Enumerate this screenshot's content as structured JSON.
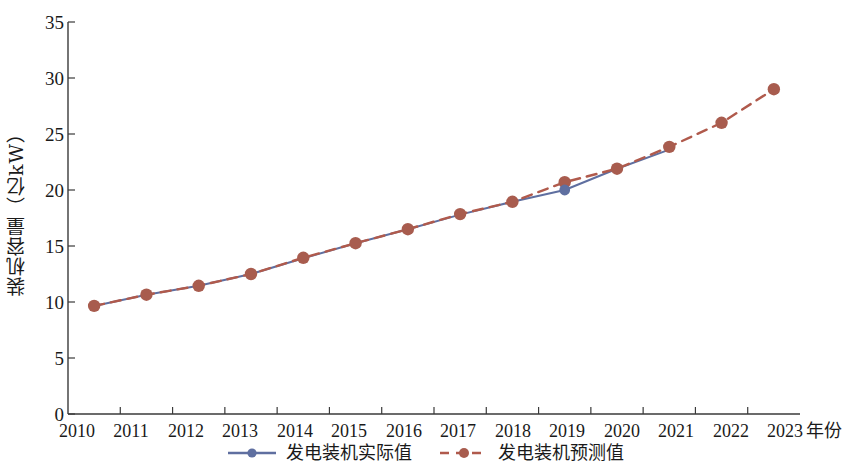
{
  "chart_data": {
    "type": "line",
    "title": "",
    "xlabel": "年份",
    "ylabel": "装机容量（亿kW）",
    "categories": [
      "2010",
      "2011",
      "2012",
      "2013",
      "2014",
      "2015",
      "2016",
      "2017",
      "2018",
      "2019",
      "2020",
      "2021",
      "2022",
      "2023"
    ],
    "x": [
      2010,
      2011,
      2012,
      2013,
      2014,
      2015,
      2016,
      2017,
      2018,
      2019,
      2020,
      2021,
      2022,
      2023
    ],
    "xlim": [
      2009.5,
      2023.5
    ],
    "ylim": [
      0,
      35
    ],
    "yticks": [
      0,
      5,
      10,
      15,
      20,
      25,
      30,
      35
    ],
    "grid": false,
    "legend_position": "bottom-center",
    "series": [
      {
        "name": "发电装机实际值",
        "style": "solid",
        "color": "#5f6fa0",
        "marker": "circle",
        "values": [
          9.65,
          10.65,
          11.45,
          12.5,
          13.9,
          15.25,
          16.5,
          17.8,
          18.95,
          20.0,
          21.9,
          23.6,
          null,
          null
        ]
      },
      {
        "name": "发电装机预测值",
        "style": "dashed",
        "color": "#b05a4c",
        "marker": "circle",
        "values": [
          9.65,
          10.65,
          11.45,
          12.5,
          13.95,
          15.25,
          16.5,
          17.85,
          18.95,
          20.7,
          21.9,
          23.85,
          26.0,
          29.0
        ]
      }
    ]
  },
  "axes": {
    "y_tick_labels": [
      "35",
      "30",
      "25",
      "20",
      "15",
      "10",
      "5",
      "0"
    ],
    "x_tick_labels": [
      "2010",
      "2011",
      "2012",
      "2013",
      "2014",
      "2015",
      "2016",
      "2017",
      "2018",
      "2019",
      "2020",
      "2021",
      "2022",
      "2023"
    ],
    "x_axis_title": "年份",
    "y_axis_title": "装机容量（亿kW）"
  },
  "legend": {
    "items": [
      {
        "label": "发电装机实际值",
        "color": "#5f6fa0",
        "style": "solid"
      },
      {
        "label": "发电装机预测值",
        "color": "#b05a4c",
        "style": "dashed"
      }
    ]
  },
  "colors": {
    "actual": "#5f6fa0",
    "predicted": "#b05a4c",
    "marker": "#a85c4e",
    "axis": "#3a3a3a"
  }
}
